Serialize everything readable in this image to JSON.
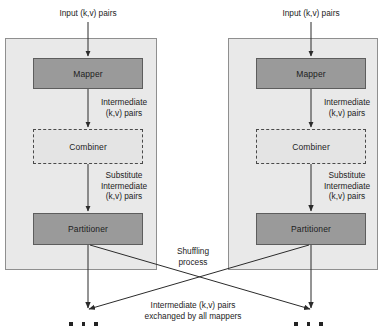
{
  "diagram": {
    "colors": {
      "panel_fill": "#e9e9e9",
      "panel_stroke": "#8f8f8f",
      "node_fill": "#9a9a9a",
      "node_stroke": "#5d5d5d",
      "dashed_fill": "#e4e4e4",
      "dashed_stroke": "#4a4a4a",
      "arrow": "#333333",
      "text": "#1d1d1d",
      "background": "#ffffff"
    }
  },
  "panels": [
    {
      "id": "mapper-panel-left",
      "input_label": "Input (k,v) pairs",
      "nodes": [
        {
          "id": "mapper",
          "label": "Mapper",
          "style": "solid"
        },
        {
          "id": "combiner",
          "label": "Combiner",
          "style": "dashed"
        },
        {
          "id": "partitioner",
          "label": "Partitioner",
          "style": "solid"
        }
      ],
      "edge_labels": [
        {
          "id": "mapper-to-combiner",
          "label": "Intermediate\n(k,v) pairs"
        },
        {
          "id": "combiner-to-partitioner",
          "label": "Substitute\nIntermediate\n(k,v) pairs"
        }
      ]
    },
    {
      "id": "mapper-panel-right",
      "input_label": "Input (k,v) pairs",
      "nodes": [
        {
          "id": "mapper",
          "label": "Mapper",
          "style": "solid"
        },
        {
          "id": "combiner",
          "label": "Combiner",
          "style": "dashed"
        },
        {
          "id": "partitioner",
          "label": "Partitioner",
          "style": "solid"
        }
      ],
      "edge_labels": [
        {
          "id": "mapper-to-combiner",
          "label": "Intermediate\n(k,v) pairs"
        },
        {
          "id": "combiner-to-partitioner",
          "label": "Substitute\nIntermediate\n(k,v) pairs"
        }
      ]
    }
  ],
  "shuffle": {
    "process_label": "Shuffling\nprocess",
    "exchange_label": "Intermediate (k,v) pairs\nexchanged by all mappers",
    "continuation_marker": "• • •"
  }
}
